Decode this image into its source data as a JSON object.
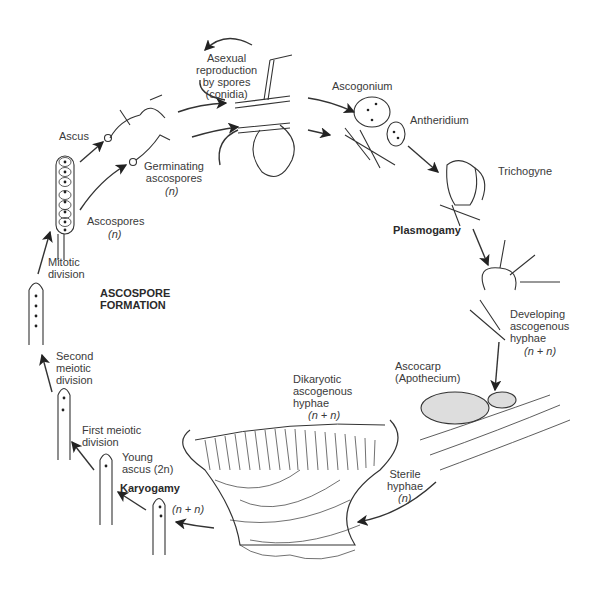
{
  "diagram": {
    "stages": [
      {
        "id": "asexual",
        "label": "Asexual\nreproduction\nby spores\n(conidia)"
      },
      {
        "id": "ascogonium",
        "label": "Ascogonium"
      },
      {
        "id": "antheridium",
        "label": "Antheridium"
      },
      {
        "id": "trichogyne",
        "label": "Trichogyne"
      },
      {
        "id": "plasmogamy",
        "label": "Plasmogamy"
      },
      {
        "id": "developing",
        "label": "Developing\nascogenous\nhyphae",
        "ploidy": "(n + n)"
      },
      {
        "id": "ascocarp",
        "label": "Ascocarp\n(Apothecium)"
      },
      {
        "id": "dikaryotic",
        "label": "Dikaryotic\nascogenous\nhyphae",
        "ploidy": "(n + n)"
      },
      {
        "id": "sterile",
        "label": "Sterile\nhyphae",
        "ploidy": "(n)"
      },
      {
        "id": "nn",
        "label": "(n + n)"
      },
      {
        "id": "karyogamy",
        "label": "Karyogamy"
      },
      {
        "id": "young_ascus",
        "label": "Young\nascus (2n)"
      },
      {
        "id": "first_meiotic",
        "label": "First meiotic\ndivision"
      },
      {
        "id": "second_meiotic",
        "label": "Second\nmeiotic\ndivision"
      },
      {
        "id": "mitotic",
        "label": "Mitotic\ndivision"
      },
      {
        "id": "ascus",
        "label": "Ascus"
      },
      {
        "id": "ascospores",
        "label": "Ascospores",
        "ploidy": "(n)"
      },
      {
        "id": "germinating",
        "label": "Germinating\nascospores",
        "ploidy": "(n)"
      },
      {
        "id": "ascospore_formation",
        "label": "ASCOSPORE\nFORMATION"
      }
    ]
  }
}
